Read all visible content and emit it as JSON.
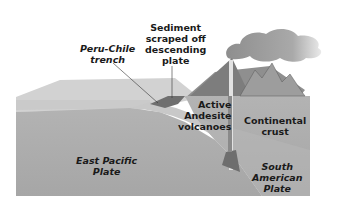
{
  "diagram": {
    "type": "subduction-zone cross-section",
    "labels": {
      "trench": {
        "lines": [
          "Peru-Chile",
          "trench"
        ]
      },
      "sediment": {
        "lines": [
          "Sediment",
          "scraped off",
          "descending",
          "plate"
        ]
      },
      "volcanoes": {
        "lines": [
          "Active",
          "Andesite",
          "volcanoes"
        ]
      },
      "continental_crust": {
        "lines": [
          "Continental",
          "crust"
        ]
      },
      "east_pacific": {
        "lines": [
          "East Pacific",
          "Plate"
        ]
      },
      "south_american": {
        "lines": [
          "South",
          "American",
          "Plate"
        ]
      }
    },
    "colors": {
      "ocean_surface": "#c9c9c9",
      "ocean_plate_front": "#a9a9a9",
      "continent_top": "#8a8a8a",
      "continent_front": "#bdbdbd",
      "smoke": "#8f8f8f",
      "magma": "#6e6e6e"
    }
  }
}
